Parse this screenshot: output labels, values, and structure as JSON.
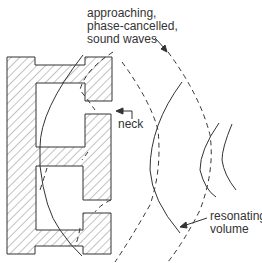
{
  "diagram": {
    "labels": {
      "waves_line1": "approaching,",
      "waves_line2": "phase-cancelled,",
      "waves_line3": "sound waves",
      "neck": "neck",
      "volume_line1": "resonating",
      "volume_line2": "volume"
    },
    "colors": {
      "stroke": "#333333",
      "hatch": "#555555",
      "background": "#ffffff"
    }
  }
}
